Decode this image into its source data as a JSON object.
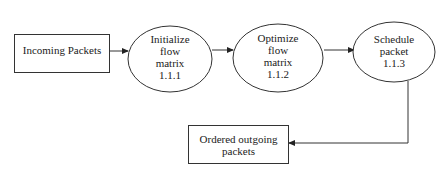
{
  "diagram": {
    "type": "data-flow",
    "colors": {
      "stroke": "#333333",
      "fill": "#ffffff",
      "text": "#222222"
    },
    "nodes": [
      {
        "id": "incoming",
        "shape": "rectangle",
        "label": "Incoming Packets"
      },
      {
        "id": "p111",
        "shape": "ellipse",
        "lines": [
          "Initialize",
          "flow",
          "matrix",
          "1.1.1"
        ]
      },
      {
        "id": "p112",
        "shape": "ellipse",
        "lines": [
          "Optimize",
          "flow",
          "matrix",
          "1.1.2"
        ]
      },
      {
        "id": "p113",
        "shape": "ellipse",
        "lines": [
          "Schedule",
          "packet",
          "1.1.3"
        ]
      },
      {
        "id": "outgoing",
        "shape": "rectangle",
        "lines": [
          "Ordered outgoing",
          "packets"
        ]
      }
    ],
    "edges": [
      {
        "from": "incoming",
        "to": "p111"
      },
      {
        "from": "p111",
        "to": "p112"
      },
      {
        "from": "p112",
        "to": "p113"
      },
      {
        "from": "p113",
        "to": "outgoing"
      }
    ]
  }
}
